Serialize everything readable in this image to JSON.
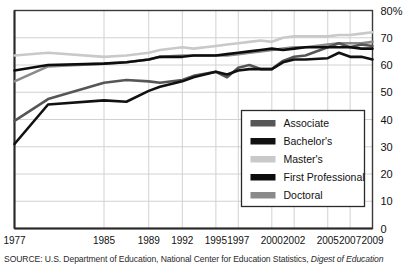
{
  "chart_data": {
    "type": "line",
    "title": "",
    "subtitle": "",
    "xlabel": "",
    "ylabel": "",
    "grid": true,
    "legend_position": "inside-lower-right",
    "ylim": [
      0,
      80
    ],
    "yticks": [
      0,
      10,
      20,
      30,
      40,
      50,
      60,
      70,
      80
    ],
    "ytick_labels": [
      "0",
      "10",
      "20",
      "30",
      "40",
      "50",
      "60",
      "70",
      "80%"
    ],
    "x": [
      1977,
      1980,
      1985,
      1987,
      1989,
      1990,
      1992,
      1993,
      1995,
      1996,
      1997,
      1998,
      1999,
      2000,
      2001,
      2002,
      2003,
      2005,
      2006,
      2007,
      2008,
      2009
    ],
    "xtick_labels": [
      "1977",
      "1985",
      "1989",
      "1992",
      "1995",
      "1997",
      "2000",
      "2002",
      "2005",
      "2007",
      "2009"
    ],
    "xticks": [
      1977,
      1985,
      1989,
      1992,
      1995,
      1997,
      2000,
      2002,
      2005,
      2007,
      2009
    ],
    "series": [
      {
        "name": "Associate",
        "color": "#565656",
        "values": [
          39.5,
          47.5,
          53.5,
          54.5,
          54.0,
          53.5,
          54.5,
          56.0,
          57.5,
          55.5,
          59.0,
          60.0,
          58.5,
          58.5,
          61.5,
          63.0,
          63.5,
          66.5,
          68.0,
          66.5,
          67.5,
          67.0
        ]
      },
      {
        "name": "Bachelor's",
        "color": "#111111",
        "values": [
          31.0,
          45.5,
          47.0,
          46.5,
          50.5,
          52.0,
          54.0,
          55.5,
          57.5,
          56.5,
          58.0,
          58.5,
          58.5,
          58.5,
          61.0,
          62.0,
          62.0,
          62.5,
          64.5,
          63.0,
          63.0,
          62.0
        ]
      },
      {
        "name": "Master's",
        "color": "#c9c9c9",
        "values": [
          63.5,
          64.5,
          63.0,
          63.5,
          64.5,
          65.5,
          66.5,
          66.0,
          67.0,
          67.5,
          68.0,
          68.5,
          69.0,
          68.5,
          70.0,
          70.5,
          70.5,
          70.5,
          71.0,
          71.0,
          71.5,
          72.0
        ]
      },
      {
        "name": "First Professional",
        "color": "#0d0d0d",
        "values": [
          58.0,
          60.0,
          60.5,
          61.0,
          62.0,
          63.0,
          63.0,
          63.5,
          63.5,
          64.0,
          64.5,
          65.0,
          65.5,
          66.0,
          65.5,
          66.0,
          66.5,
          66.5,
          66.5,
          66.5,
          66.0,
          66.0
        ]
      },
      {
        "name": "Doctoral",
        "color": "#8a8a8a",
        "values": [
          54.0,
          59.5,
          60.5,
          61.0,
          62.0,
          63.0,
          63.5,
          63.5,
          63.5,
          63.5,
          64.0,
          64.5,
          65.0,
          65.5,
          66.0,
          66.5,
          66.5,
          67.5,
          68.0,
          68.0,
          68.0,
          68.5
        ]
      }
    ]
  },
  "legend": {
    "items": [
      {
        "label": "Associate"
      },
      {
        "label": "Bachelor's"
      },
      {
        "label": "Master's"
      },
      {
        "label": "First Professional"
      },
      {
        "label": "Doctoral"
      }
    ]
  },
  "source": {
    "prefix": "SOURCE: U.S. Department of Education, National Center for Education Statistics, ",
    "italic": "Digest of Education"
  }
}
